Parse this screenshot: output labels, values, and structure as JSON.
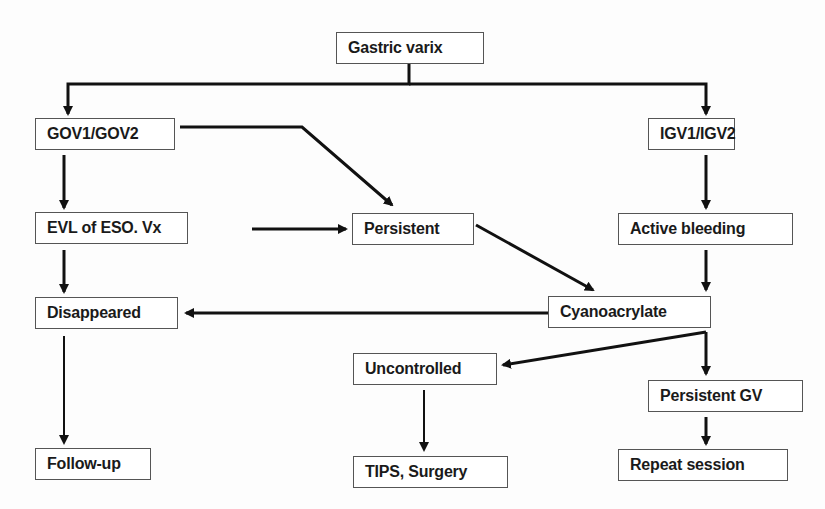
{
  "diagram": {
    "type": "flowchart",
    "nodes": [
      {
        "id": "gastric_varix",
        "label": "Gastric varix",
        "x": 336,
        "y": 32,
        "w": 148,
        "h": 32
      },
      {
        "id": "gov",
        "label": "GOV1/GOV2",
        "x": 35,
        "y": 118,
        "w": 140,
        "h": 32
      },
      {
        "id": "igv",
        "label": "IGV1/IGV2",
        "x": 648,
        "y": 118,
        "w": 87,
        "h": 32
      },
      {
        "id": "evl",
        "label": "EVL of ESO. Vx",
        "x": 35,
        "y": 212,
        "w": 153,
        "h": 32
      },
      {
        "id": "persistent",
        "label": "Persistent",
        "x": 352,
        "y": 213,
        "w": 122,
        "h": 32
      },
      {
        "id": "active_bleeding",
        "label": "Active bleeding",
        "x": 618,
        "y": 213,
        "w": 175,
        "h": 32
      },
      {
        "id": "disappeared",
        "label": "Disappeared",
        "x": 35,
        "y": 297,
        "w": 143,
        "h": 32
      },
      {
        "id": "cyanoacrylate",
        "label": "Cyanoacrylate",
        "x": 548,
        "y": 296,
        "w": 163,
        "h": 32
      },
      {
        "id": "uncontrolled",
        "label": "Uncontrolled",
        "x": 353,
        "y": 353,
        "w": 144,
        "h": 32
      },
      {
        "id": "persistent_gv",
        "label": "Persistent GV",
        "x": 648,
        "y": 380,
        "w": 155,
        "h": 32
      },
      {
        "id": "follow_up",
        "label": "Follow-up",
        "x": 35,
        "y": 448,
        "w": 116,
        "h": 32
      },
      {
        "id": "tips_surgery",
        "label": "TIPS, Surgery",
        "x": 353,
        "y": 456,
        "w": 155,
        "h": 32
      },
      {
        "id": "repeat_session",
        "label": "Repeat session",
        "x": 618,
        "y": 449,
        "w": 170,
        "h": 32
      }
    ],
    "edges": [
      {
        "from": "gastric_varix",
        "to": "gov"
      },
      {
        "from": "gastric_varix",
        "to": "igv"
      },
      {
        "from": "gov",
        "to": "evl"
      },
      {
        "from": "gov",
        "to": "active_bleeding"
      },
      {
        "from": "igv",
        "to": "active_bleeding"
      },
      {
        "from": "evl",
        "to": "persistent"
      },
      {
        "from": "evl",
        "to": "disappeared"
      },
      {
        "from": "persistent",
        "to": "cyanoacrylate"
      },
      {
        "from": "active_bleeding",
        "to": "cyanoacrylate"
      },
      {
        "from": "cyanoacrylate",
        "to": "disappeared"
      },
      {
        "from": "cyanoacrylate",
        "to": "uncontrolled"
      },
      {
        "from": "cyanoacrylate",
        "to": "persistent_gv"
      },
      {
        "from": "disappeared",
        "to": "follow_up"
      },
      {
        "from": "uncontrolled",
        "to": "tips_surgery"
      },
      {
        "from": "persistent_gv",
        "to": "repeat_session"
      }
    ],
    "colors": {
      "line": "#111111",
      "box_border": "#555555",
      "background": "#fdfdfd"
    }
  }
}
